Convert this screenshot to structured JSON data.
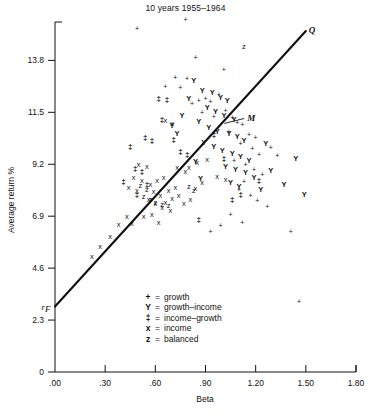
{
  "chart": {
    "title": "10 years 1955–1964",
    "xlabel": "Beta",
    "ylabel": "Average return %",
    "annotations": {
      "line_top_label": "Q",
      "market_label": "M",
      "riskfree_label": "r",
      "riskfree_sub": "F"
    }
  },
  "legend": {
    "items": [
      {
        "symbol": "+",
        "eq": "=",
        "label": "growth",
        "key": "growth"
      },
      {
        "symbol": "Y",
        "eq": "=",
        "label": "growth–income",
        "key": "growth-income"
      },
      {
        "symbol": "‡",
        "eq": "=",
        "label": "income–growth",
        "key": "income-growth"
      },
      {
        "symbol": "x",
        "eq": "=",
        "label": "income",
        "key": "income"
      },
      {
        "symbol": "z",
        "eq": "=",
        "label": "balanced",
        "key": "balanced"
      }
    ]
  },
  "chart_data": {
    "type": "scatter",
    "title": "10 years 1955–1964",
    "xlabel": "Beta",
    "ylabel": "Average return %",
    "xlim": [
      0.0,
      1.8
    ],
    "ylim": [
      0.0,
      15.5
    ],
    "xticks": [
      0.0,
      0.3,
      0.6,
      0.9,
      1.2,
      1.5,
      1.8
    ],
    "xticklabels": [
      ".00",
      ".30",
      ".60",
      ".90",
      "1.20",
      "1.50",
      "1.80"
    ],
    "yticks": [
      0.0,
      2.3,
      4.6,
      6.9,
      9.2,
      11.5,
      13.8
    ],
    "yticklabels": [
      "0",
      "2.3",
      "4.6",
      "6.9",
      "9.2",
      "11.5",
      "13.8"
    ],
    "grid": false,
    "legend_position": "inside-bottom-center",
    "reference_line": {
      "name": "capital-market-line",
      "label_at_end": "Q",
      "intercept_y": 2.9,
      "intercept_label": "r_F",
      "x_start": 0.0,
      "y_start": 2.9,
      "x_end": 1.5,
      "y_end": 15.1,
      "market_point_label": "M",
      "market_point_x": 1.0,
      "market_point_y": 11.05
    },
    "series": [
      {
        "name": "growth",
        "marker": "+",
        "points": [
          [
            0.49,
            15.2
          ],
          [
            0.78,
            15.6
          ],
          [
            0.72,
            13.0
          ],
          [
            0.79,
            12.95
          ],
          [
            0.75,
            12.55
          ],
          [
            0.86,
            12.0
          ],
          [
            0.82,
            11.85
          ],
          [
            0.9,
            12.1
          ],
          [
            0.93,
            11.95
          ],
          [
            0.98,
            12.25
          ],
          [
            0.88,
            11.45
          ],
          [
            0.95,
            11.3
          ],
          [
            1.02,
            11.55
          ],
          [
            1.06,
            11.25
          ],
          [
            1.09,
            11.0
          ],
          [
            1.12,
            10.95
          ],
          [
            1.04,
            10.6
          ],
          [
            1.16,
            10.5
          ],
          [
            1.2,
            10.35
          ],
          [
            1.11,
            10.1
          ],
          [
            1.18,
            9.85
          ],
          [
            1.22,
            9.6
          ],
          [
            1.07,
            9.35
          ],
          [
            1.14,
            9.15
          ],
          [
            1.19,
            8.95
          ],
          [
            1.24,
            8.7
          ],
          [
            1.13,
            8.4
          ],
          [
            1.1,
            8.05
          ],
          [
            1.17,
            7.8
          ],
          [
            1.21,
            7.55
          ],
          [
            1.29,
            9.9
          ],
          [
            1.33,
            9.55
          ],
          [
            1.27,
            7.3
          ],
          [
            1.05,
            6.95
          ],
          [
            1.12,
            6.6
          ],
          [
            1.41,
            6.2
          ],
          [
            1.46,
            3.1
          ],
          [
            0.99,
            6.45
          ],
          [
            0.93,
            6.2
          ],
          [
            0.84,
            13.9
          ],
          [
            1.01,
            13.35
          ],
          [
            0.66,
            12.6
          ]
        ]
      },
      {
        "name": "growth-income",
        "marker": "Y",
        "points": [
          [
            0.83,
            12.9
          ],
          [
            0.88,
            12.45
          ],
          [
            0.94,
            12.35
          ],
          [
            0.99,
            12.15
          ],
          [
            1.03,
            12.0
          ],
          [
            0.91,
            11.7
          ],
          [
            0.96,
            11.5
          ],
          [
            1.01,
            11.35
          ],
          [
            1.07,
            11.15
          ],
          [
            0.86,
            11.05
          ],
          [
            0.92,
            10.8
          ],
          [
            0.97,
            10.65
          ],
          [
            1.04,
            10.55
          ],
          [
            1.09,
            10.4
          ],
          [
            1.13,
            10.25
          ],
          [
            0.89,
            10.15
          ],
          [
            0.95,
            9.95
          ],
          [
            1.0,
            9.8
          ],
          [
            1.06,
            9.65
          ],
          [
            1.11,
            9.5
          ],
          [
            1.16,
            9.35
          ],
          [
            0.84,
            9.3
          ],
          [
            1.02,
            9.1
          ],
          [
            1.08,
            8.95
          ],
          [
            1.14,
            8.8
          ],
          [
            1.19,
            8.6
          ],
          [
            0.87,
            8.55
          ],
          [
            1.05,
            8.35
          ],
          [
            1.1,
            8.2
          ],
          [
            1.23,
            8.05
          ],
          [
            1.29,
            8.9
          ],
          [
            1.37,
            8.3
          ],
          [
            0.8,
            12.1
          ],
          [
            0.76,
            11.35
          ],
          [
            1.26,
            10.1
          ],
          [
            1.44,
            9.45
          ],
          [
            1.49,
            7.85
          ],
          [
            0.7,
            10.9
          ],
          [
            0.73,
            10.55
          ]
        ]
      },
      {
        "name": "income-growth",
        "marker": "‡",
        "points": [
          [
            0.62,
            12.1
          ],
          [
            0.67,
            12.05
          ],
          [
            0.64,
            11.15
          ],
          [
            0.54,
            10.35
          ],
          [
            0.58,
            10.25
          ],
          [
            0.71,
            10.3
          ],
          [
            0.45,
            9.95
          ],
          [
            0.75,
            9.75
          ],
          [
            0.48,
            9.0
          ],
          [
            0.52,
            8.85
          ],
          [
            0.41,
            8.4
          ],
          [
            0.55,
            8.3
          ],
          [
            0.79,
            9.6
          ],
          [
            1.01,
            9.45
          ],
          [
            1.22,
            8.45
          ],
          [
            1.11,
            7.85
          ],
          [
            1.06,
            7.6
          ],
          [
            0.86,
            6.75
          ],
          [
            0.49,
            7.85
          ],
          [
            0.95,
            10.5
          ]
        ]
      },
      {
        "name": "income",
        "marker": "x",
        "points": [
          [
            0.22,
            5.1
          ],
          [
            0.27,
            5.55
          ],
          [
            0.33,
            6.0
          ],
          [
            0.38,
            6.5
          ],
          [
            0.43,
            6.85
          ],
          [
            0.5,
            9.15
          ],
          [
            0.55,
            9.1
          ],
          [
            0.47,
            8.6
          ],
          [
            0.52,
            8.45
          ],
          [
            0.57,
            8.3
          ],
          [
            0.44,
            8.15
          ],
          [
            0.49,
            8.0
          ],
          [
            0.61,
            8.45
          ],
          [
            0.65,
            8.6
          ],
          [
            0.59,
            7.95
          ],
          [
            0.63,
            7.8
          ],
          [
            0.68,
            8.0
          ],
          [
            0.72,
            8.15
          ],
          [
            0.56,
            7.6
          ],
          [
            0.6,
            7.45
          ],
          [
            0.66,
            7.5
          ],
          [
            0.7,
            7.65
          ],
          [
            0.74,
            7.8
          ],
          [
            0.64,
            7.25
          ],
          [
            0.69,
            7.15
          ],
          [
            0.77,
            7.45
          ],
          [
            0.81,
            7.6
          ],
          [
            0.84,
            8.1
          ],
          [
            0.88,
            8.35
          ],
          [
            0.8,
            9.05
          ],
          [
            0.85,
            9.25
          ],
          [
            0.91,
            9.4
          ],
          [
            0.73,
            9.05
          ],
          [
            0.78,
            8.85
          ],
          [
            0.58,
            6.95
          ],
          [
            0.53,
            6.85
          ],
          [
            0.97,
            8.65
          ],
          [
            1.02,
            8.5
          ],
          [
            0.66,
            11.1
          ],
          [
            0.7,
            11.0
          ],
          [
            0.46,
            6.55
          ],
          [
            0.62,
            6.6
          ]
        ]
      },
      {
        "name": "balanced",
        "marker": "z",
        "points": [
          [
            0.51,
            8.25
          ],
          [
            0.55,
            8.05
          ],
          [
            0.53,
            7.75
          ],
          [
            0.57,
            7.6
          ],
          [
            0.6,
            7.5
          ],
          [
            0.64,
            7.4
          ],
          [
            0.68,
            7.35
          ],
          [
            0.8,
            8.2
          ],
          [
            0.83,
            8.0
          ],
          [
            1.13,
            14.4
          ]
        ]
      }
    ]
  }
}
